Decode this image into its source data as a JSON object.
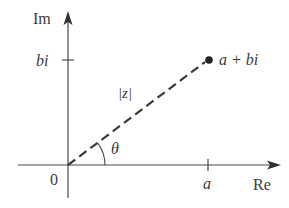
{
  "diagram": {
    "labels": {
      "imaginary_axis": "Im",
      "real_axis": "Re",
      "origin": "0",
      "b_tick": "bi",
      "a_tick": "a",
      "point": "a + bi",
      "modulus": "|z|",
      "angle": "θ"
    },
    "colors": {
      "axis": "#4a4a4a",
      "vector": "#3a3a3a",
      "text": "#3a3a3a",
      "background": "#ffffff"
    },
    "geometry": {
      "origin": [
        68,
        165
      ],
      "point": [
        208,
        60
      ],
      "vertical_axis_top": 13,
      "vertical_axis_bottom": 198,
      "horizontal_axis_left": 18,
      "horizontal_axis_right": 278
    }
  }
}
